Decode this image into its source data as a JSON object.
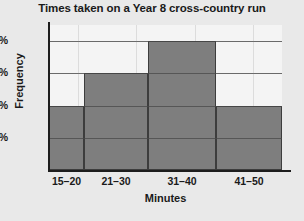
{
  "chart_data": {
    "type": "bar",
    "title": "Times taken on a Year 8 cross-country run",
    "xlabel": "Minutes",
    "ylabel": "Frequency",
    "categories": [
      "15–20",
      "21–30",
      "31–40",
      "41–50"
    ],
    "values": [
      10,
      15,
      20,
      10
    ],
    "value_labels": [
      "10%",
      "15%",
      "20%",
      "10%"
    ],
    "bar_widths": [
      35,
      64,
      68,
      66
    ],
    "ytick_labels": [
      "5%",
      "10%",
      "15%",
      "20%"
    ],
    "ytick_values": [
      5,
      10,
      15,
      20
    ],
    "ylim": [
      0,
      22.5
    ],
    "xlim_note": "histogram with unequal class widths",
    "grid": "horizontal gridlines at 5%, 10%, 15%, 20% plus faint vertical gridlines",
    "legend": "none",
    "colors": {
      "bar_fill": "#7e7e7e",
      "bar_edge": "#3d3d3d",
      "axis": "#1d1d1d",
      "gridline": "#c9c9c9",
      "plot_background": "#f4f4f4",
      "figure_background": "#e9e9e9",
      "text": "#1a1a1a"
    }
  }
}
